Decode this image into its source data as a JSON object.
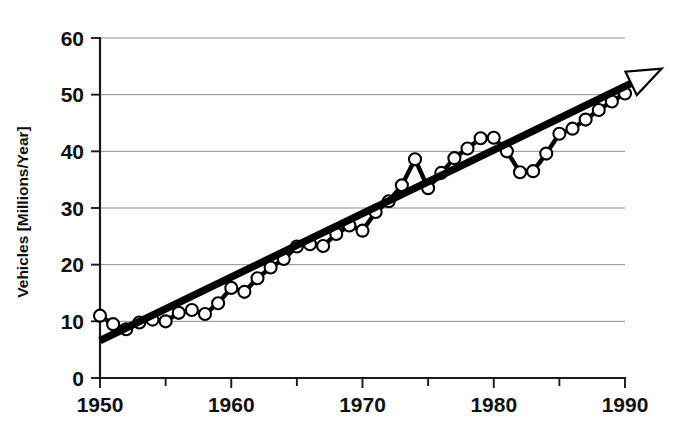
{
  "chart_data": {
    "type": "line",
    "title": "",
    "subtitle": "",
    "xlabel": "",
    "ylabel": "Vehicles [Millions/Year]",
    "xlim": [
      1950,
      1990
    ],
    "ylim": [
      0,
      60
    ],
    "x_ticks_major": [
      1950,
      1960,
      1970,
      1980,
      1990
    ],
    "x_ticks_minor": [
      1955,
      1965,
      1975,
      1985
    ],
    "x_tick_labels": [
      "1950",
      "1960",
      "1970",
      "1980",
      "1990"
    ],
    "y_ticks": [
      0,
      10,
      20,
      30,
      40,
      50,
      60
    ],
    "y_tick_labels": [
      "0",
      "10",
      "20",
      "30",
      "40",
      "50",
      "60"
    ],
    "grid": "horizontal",
    "legend": "none",
    "x": [
      1950,
      1951,
      1952,
      1953,
      1954,
      1955,
      1956,
      1957,
      1958,
      1959,
      1960,
      1961,
      1962,
      1963,
      1964,
      1965,
      1966,
      1967,
      1968,
      1969,
      1970,
      1971,
      1972,
      1973,
      1974,
      1975,
      1976,
      1977,
      1978,
      1979,
      1980,
      1981,
      1982,
      1983,
      1984,
      1985,
      1986,
      1987,
      1988,
      1989,
      1990
    ],
    "series": [
      {
        "name": "Vehicles produced",
        "marker": "open-circle",
        "values": [
          11.0,
          9.5,
          8.6,
          9.8,
          10.3,
          10.0,
          11.5,
          12.0,
          11.3,
          13.2,
          15.9,
          15.2,
          17.6,
          19.5,
          21.0,
          23.2,
          23.6,
          23.3,
          25.4,
          26.9,
          26.0,
          29.3,
          31.2,
          34.0,
          38.6,
          33.5,
          36.2,
          38.8,
          40.5,
          42.3,
          42.4,
          40.0,
          36.3,
          36.5,
          39.6,
          43.1,
          44.0,
          45.6,
          47.3,
          48.8,
          50.2
        ]
      }
    ],
    "trend_line": {
      "name": "Linear trend (arrow)",
      "x_start": 1950,
      "y_start": 6.6,
      "x_end": 1990,
      "y_end": 51.5,
      "x_arrow_tip": 1992.8,
      "y_arrow_tip": 54.6,
      "style": "thick-solid-with-open-arrowhead"
    },
    "colors": {
      "series_line": "#000000",
      "marker_fill": "#ffffff",
      "marker_stroke": "#000000",
      "trend": "#000000",
      "grid": "#8d8d8d",
      "axis": "#1a1a1a",
      "background": "#ffffff"
    }
  }
}
